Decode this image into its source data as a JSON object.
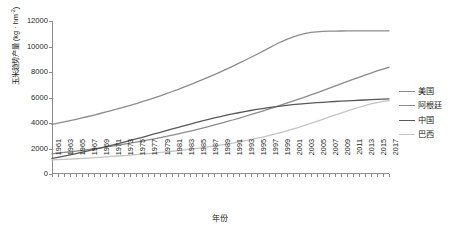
{
  "chart_data": {
    "type": "line",
    "title": "",
    "xlabel": "年份",
    "ylabel_main": "玉米趋势产量 (kg · hm",
    "ylabel_sup": "-2",
    "ylabel_tail": ")",
    "ylabel_full": "玉米趋势产量 (kg · hm-2)",
    "xlim": [
      1961,
      2017
    ],
    "ylim": [
      0,
      12000
    ],
    "y_ticks": [
      0,
      2000,
      4000,
      6000,
      8000,
      10000,
      12000
    ],
    "y_tick_labels": [
      "0",
      "2000",
      "4000",
      "6000",
      "8000",
      "10000",
      "12000"
    ],
    "grid": false,
    "legend_position": "right",
    "x_tick_labels": [
      "1961",
      "1963",
      "1965",
      "1967",
      "1969",
      "1971",
      "1973",
      "1975",
      "1977",
      "1979",
      "1981",
      "1983",
      "1985",
      "1987",
      "1989",
      "1991",
      "1993",
      "1995",
      "1997",
      "1999",
      "2001",
      "2003",
      "2005",
      "2007",
      "2009",
      "2011",
      "2013",
      "2015",
      "2017"
    ],
    "x_all_years": [
      1961,
      1962,
      1963,
      1964,
      1965,
      1966,
      1967,
      1968,
      1969,
      1970,
      1971,
      1972,
      1973,
      1974,
      1975,
      1976,
      1977,
      1978,
      1979,
      1980,
      1981,
      1982,
      1983,
      1984,
      1985,
      1986,
      1987,
      1988,
      1989,
      1990,
      1991,
      1992,
      1993,
      1994,
      1995,
      1996,
      1997,
      1998,
      1999,
      2000,
      2001,
      2002,
      2003,
      2004,
      2005,
      2006,
      2007,
      2008,
      2009,
      2010,
      2011,
      2012,
      2013,
      2014,
      2015,
      2016,
      2017
    ],
    "series": [
      {
        "name": "美国",
        "color": "#8c8c8c",
        "values": [
          3900,
          3990,
          4085,
          4185,
          4290,
          4400,
          4510,
          4625,
          4745,
          4865,
          4990,
          5120,
          5250,
          5385,
          5525,
          5670,
          5820,
          5975,
          6135,
          6300,
          6470,
          6645,
          6825,
          7010,
          7200,
          7395,
          7595,
          7800,
          8010,
          8225,
          8445,
          8670,
          8900,
          9135,
          9375,
          9620,
          9870,
          10120,
          10350,
          10560,
          10740,
          10890,
          11010,
          11100,
          11150,
          11180,
          11200,
          11210,
          11215,
          11218,
          11220,
          11221,
          11222,
          11223,
          11224,
          11225,
          11226
        ]
      },
      {
        "name": "阿根廷",
        "color": "#8c8c8c",
        "values": [
          1590,
          1640,
          1690,
          1745,
          1800,
          1860,
          1920,
          1985,
          2050,
          2120,
          2190,
          2265,
          2340,
          2420,
          2500,
          2585,
          2670,
          2760,
          2855,
          2950,
          3050,
          3155,
          3260,
          3370,
          3485,
          3600,
          3720,
          3845,
          3970,
          4100,
          4235,
          4370,
          4510,
          4650,
          4795,
          4940,
          5090,
          5240,
          5395,
          5550,
          5710,
          5870,
          6035,
          6200,
          6370,
          6540,
          6715,
          6890,
          7065,
          7240,
          7415,
          7585,
          7755,
          7920,
          8080,
          8230,
          8370
        ]
      },
      {
        "name": "中国",
        "color": "#595959",
        "values": [
          1220,
          1310,
          1405,
          1505,
          1605,
          1710,
          1815,
          1925,
          2035,
          2150,
          2265,
          2385,
          2505,
          2630,
          2755,
          2880,
          3010,
          3140,
          3270,
          3400,
          3530,
          3660,
          3790,
          3915,
          4040,
          4160,
          4280,
          4395,
          4505,
          4610,
          4710,
          4805,
          4895,
          4980,
          5060,
          5135,
          5205,
          5270,
          5330,
          5385,
          5435,
          5480,
          5520,
          5560,
          5595,
          5625,
          5655,
          5685,
          5710,
          5735,
          5760,
          5785,
          5805,
          5830,
          5850,
          5870,
          5890
        ]
      },
      {
        "name": "巴西",
        "color": "#c4c4c4",
        "values": [
          1100,
          1120,
          1145,
          1170,
          1195,
          1220,
          1250,
          1280,
          1310,
          1340,
          1375,
          1410,
          1445,
          1480,
          1520,
          1560,
          1600,
          1645,
          1690,
          1735,
          1785,
          1835,
          1890,
          1945,
          2005,
          2065,
          2130,
          2200,
          2270,
          2345,
          2425,
          2510,
          2600,
          2695,
          2795,
          2900,
          3010,
          3125,
          3250,
          3380,
          3520,
          3665,
          3815,
          3970,
          4130,
          4290,
          4455,
          4620,
          4780,
          4940,
          5090,
          5235,
          5370,
          5495,
          5605,
          5695,
          5760
        ]
      }
    ]
  },
  "legend": {
    "items": [
      {
        "label": "美国",
        "color": "#8c8c8c"
      },
      {
        "label": "阿根廷",
        "color": "#8c8c8c"
      },
      {
        "label": "中国",
        "color": "#595959"
      },
      {
        "label": "巴西",
        "color": "#c4c4c4"
      }
    ]
  },
  "axes": {
    "x_title": "年份",
    "y_title_prefix": "玉米趋势产量 (kg · hm",
    "y_title_exponent": "-2",
    "y_title_suffix": ")"
  }
}
